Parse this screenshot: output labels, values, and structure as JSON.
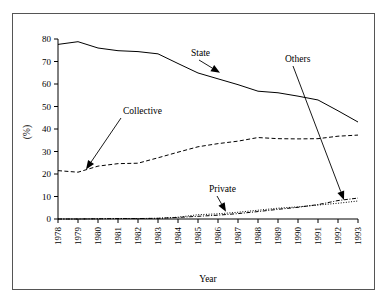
{
  "chart_data": {
    "type": "line",
    "title": "",
    "xlabel": "Year",
    "ylabel": "(%)",
    "xlim": [
      1978,
      1993
    ],
    "ylim": [
      0,
      80
    ],
    "ytick_values": [
      0,
      10,
      20,
      30,
      40,
      50,
      60,
      70,
      80
    ],
    "ytick_labels": [
      "0",
      "10",
      "20",
      "30",
      "40",
      "50",
      "60",
      "70",
      "80"
    ],
    "grid": false,
    "legend_position": "none (inline arrow annotations)",
    "categories": [
      1978,
      1979,
      1980,
      1981,
      1982,
      1983,
      1984,
      1985,
      1986,
      1987,
      1988,
      1989,
      1990,
      1991,
      1992,
      1993
    ],
    "xtick_labels": [
      "1978",
      "1979",
      "1980",
      "1981",
      "1982",
      "1983",
      "1984",
      "1985",
      "1986",
      "1987",
      "1988",
      "1989",
      "1990",
      "1991",
      "1992",
      "1993"
    ],
    "series": [
      {
        "name": "State",
        "style": "solid",
        "values": [
          77.6,
          78.8,
          76.0,
          74.8,
          74.4,
          73.4,
          69.1,
          64.9,
          62.3,
          59.7,
          56.8,
          56.1,
          54.6,
          52.9,
          48.1,
          43.1
        ]
      },
      {
        "name": "Collective",
        "style": "dashed",
        "values": [
          21.5,
          20.8,
          23.5,
          24.6,
          24.8,
          27.2,
          29.7,
          32.1,
          33.5,
          34.6,
          36.2,
          35.7,
          35.6,
          35.7,
          36.8,
          37.3
        ]
      },
      {
        "name": "Private",
        "style": "dotted",
        "values": [
          0.0,
          0.0,
          0.1,
          0.2,
          0.2,
          0.3,
          0.8,
          1.9,
          2.3,
          3.0,
          3.9,
          4.8,
          5.4,
          6.2,
          7.0,
          8.0
        ]
      },
      {
        "name": "Others",
        "style": "dash-dot",
        "values": [
          0.0,
          0.0,
          0.1,
          0.2,
          0.2,
          0.3,
          0.7,
          1.2,
          1.7,
          2.4,
          3.3,
          4.3,
          5.2,
          6.4,
          8.2,
          9.3
        ]
      }
    ],
    "annotations": [
      {
        "text": "State",
        "point": [
          1986.1,
          65.0
        ]
      },
      {
        "text": "Collective",
        "point": [
          1979.4,
          22.0
        ]
      },
      {
        "text": "Private",
        "point": [
          1986.4,
          3.2
        ]
      },
      {
        "text": "Others",
        "point": [
          1992.3,
          8.4
        ]
      }
    ]
  },
  "axes": {
    "x_axis_title": "Year",
    "y_axis_title": "(%)"
  },
  "top_caption": ""
}
